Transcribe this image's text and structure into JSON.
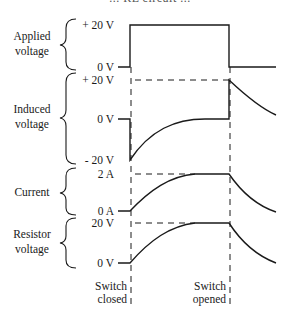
{
  "figure": {
    "title": "... RL circuit ...",
    "switch_closed_label": [
      "Switch",
      "closed"
    ],
    "switch_opened_label": [
      "Switch",
      "opened"
    ]
  },
  "panels": [
    {
      "name": "Applied voltage",
      "label_lines": [
        "Applied",
        "voltage"
      ],
      "ticks": [
        {
          "label": "+ 20 V"
        },
        {
          "label": "0 V"
        }
      ]
    },
    {
      "name": "Induced voltage",
      "label_lines": [
        "Induced",
        "voltage"
      ],
      "ticks": [
        {
          "label": "+ 20 V"
        },
        {
          "label": "0 V"
        },
        {
          "label": "- 20 V"
        }
      ]
    },
    {
      "name": "Current",
      "label_lines": [
        "Current"
      ],
      "ticks": [
        {
          "label": "2 A"
        },
        {
          "label": "0 A"
        }
      ]
    },
    {
      "name": "Resistor voltage",
      "label_lines": [
        "Resistor",
        "voltage"
      ],
      "ticks": [
        {
          "label": "20 V"
        },
        {
          "label": "0 V"
        }
      ]
    }
  ],
  "colors": {
    "line": "#1a1a1a",
    "background": "#ffffff"
  }
}
